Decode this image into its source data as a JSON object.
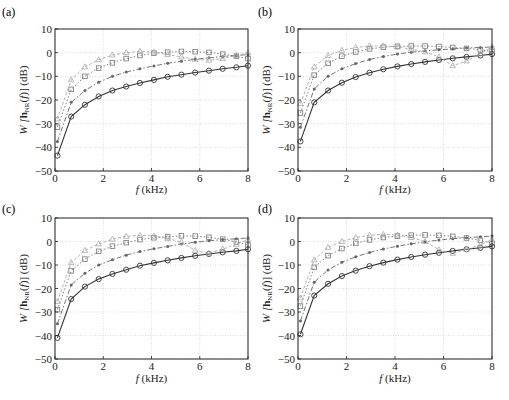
{
  "chart_data": [
    {
      "type": "line",
      "panel_label": "(a)",
      "xlabel": "f (kHz)",
      "ylabel": "W [h_NR(f)] (dB)",
      "ylabel_parts": {
        "script": "W",
        "bold": "h",
        "sub": "NR",
        "arg": "(f)",
        "unit": "(dB)"
      },
      "xlim": [
        0,
        8
      ],
      "ylim": [
        -50,
        10
      ],
      "xticks": [
        0,
        2,
        4,
        6,
        8
      ],
      "yticks": [
        10,
        0,
        -10,
        -20,
        -30,
        -40,
        -50
      ],
      "grid": true,
      "x": [
        0.1,
        0.67,
        1.24,
        1.81,
        2.38,
        2.95,
        3.52,
        4.1,
        4.67,
        5.24,
        5.81,
        6.38,
        6.95,
        7.52,
        8.0
      ],
      "series": [
        {
          "name": "circle-solid",
          "marker": "circle",
          "style": "solid",
          "color": "#333333",
          "values": [
            -43.5,
            -27,
            -22,
            -18.5,
            -16,
            -14.3,
            -12.8,
            -11.5,
            -10.2,
            -9.3,
            -8.4,
            -7.6,
            -6.8,
            -6.2,
            -5.5
          ]
        },
        {
          "name": "star-dashdot",
          "marker": "star",
          "style": "dashdot",
          "color": "#666666",
          "values": [
            -37.5,
            -21,
            -16,
            -12.5,
            -10,
            -8.2,
            -6.8,
            -5.6,
            -4.5,
            -3.6,
            -2.8,
            -2.2,
            -1.6,
            -1.2,
            -0.8
          ]
        },
        {
          "name": "square-dotted",
          "marker": "square",
          "style": "dotted",
          "color": "#777777",
          "values": [
            -31.5,
            -15.5,
            -10,
            -6.5,
            -4.3,
            -2.5,
            -1.2,
            -0.2,
            0.2,
            0.5,
            0.4,
            0.1,
            -0.6,
            -1.5,
            -2.5
          ]
        },
        {
          "name": "triangle-dotted",
          "marker": "triangle",
          "style": "dashed",
          "color": "#aaaaaa",
          "values": [
            -28,
            -11.5,
            -6,
            -3,
            -1,
            0,
            0.6,
            0.2,
            -0.8,
            -1.8,
            -2.8,
            -3.2,
            -2.5,
            -1.2,
            0
          ]
        }
      ]
    },
    {
      "type": "line",
      "panel_label": "(b)",
      "xlabel": "f (kHz)",
      "ylabel": "W [h_NR(f)] (dB)",
      "ylabel_parts": {
        "script": "W",
        "bold": "h",
        "sub": "NR",
        "arg": "(f)",
        "unit": "(dB)"
      },
      "xlim": [
        0,
        8
      ],
      "ylim": [
        -50,
        10
      ],
      "xticks": [
        0,
        2,
        4,
        6,
        8
      ],
      "yticks": [
        10,
        0,
        -10,
        -20,
        -30,
        -40,
        -50
      ],
      "grid": true,
      "x": [
        0.1,
        0.67,
        1.24,
        1.81,
        2.38,
        2.95,
        3.52,
        4.1,
        4.67,
        5.24,
        5.81,
        6.38,
        6.95,
        7.52,
        8.0
      ],
      "series": [
        {
          "name": "circle-solid",
          "marker": "circle",
          "style": "solid",
          "color": "#333333",
          "values": [
            -37.5,
            -21,
            -16,
            -12.7,
            -10.3,
            -8.5,
            -7,
            -5.8,
            -4.8,
            -3.9,
            -3.1,
            -2.4,
            -1.8,
            -1.2,
            -0.6
          ]
        },
        {
          "name": "star-dashdot",
          "marker": "star",
          "style": "dashdot",
          "color": "#666666",
          "values": [
            -31.5,
            -15.3,
            -10,
            -6.8,
            -4.6,
            -2.9,
            -1.6,
            -0.6,
            0.2,
            0.8,
            1.2,
            1.6,
            2,
            2.2,
            2.4
          ]
        },
        {
          "name": "square-dotted",
          "marker": "square",
          "style": "dotted",
          "color": "#777777",
          "values": [
            -25.5,
            -9.5,
            -4.5,
            -1.5,
            0.3,
            1.6,
            2.3,
            2.7,
            2.8,
            2.8,
            2.6,
            2.2,
            1.8,
            1.2,
            0.5
          ]
        },
        {
          "name": "triangle-dotted",
          "marker": "triangle",
          "style": "dashed",
          "color": "#aaaaaa",
          "values": [
            -21.5,
            -6,
            -1.2,
            1,
            2.2,
            2.8,
            2.9,
            2.4,
            1.5,
            0.3,
            -1.8,
            -5.5,
            -3.5,
            -0.5,
            2.5
          ]
        }
      ]
    },
    {
      "type": "line",
      "panel_label": "(c)",
      "xlabel": "f (kHz)",
      "ylabel": "W [h_NR(f)] (dB)",
      "ylabel_parts": {
        "script": "W",
        "bold": "h",
        "sub": "NR",
        "arg": "(f)",
        "unit": "(dB)"
      },
      "xlim": [
        0,
        8
      ],
      "ylim": [
        -50,
        10
      ],
      "xticks": [
        0,
        2,
        4,
        6,
        8
      ],
      "yticks": [
        10,
        0,
        -10,
        -20,
        -30,
        -40,
        -50
      ],
      "grid": true,
      "x": [
        0.1,
        0.67,
        1.24,
        1.81,
        2.38,
        2.95,
        3.52,
        4.1,
        4.67,
        5.24,
        5.81,
        6.38,
        6.95,
        7.52,
        8.0
      ],
      "series": [
        {
          "name": "circle-solid",
          "marker": "circle",
          "style": "solid",
          "color": "#333333",
          "values": [
            -41,
            -24.5,
            -19.2,
            -16,
            -13.8,
            -12,
            -10.3,
            -9.1,
            -8,
            -7,
            -6.1,
            -5.3,
            -4.6,
            -4,
            -3.3
          ]
        },
        {
          "name": "star-dashdot",
          "marker": "star",
          "style": "dashdot",
          "color": "#666666",
          "values": [
            -35,
            -18.5,
            -13.5,
            -10,
            -7.8,
            -5.8,
            -4.3,
            -3.1,
            -2.1,
            -1.1,
            -0.3,
            0.3,
            0.8,
            1.2,
            1.5
          ]
        },
        {
          "name": "square-dotted",
          "marker": "square",
          "style": "dotted",
          "color": "#777777",
          "values": [
            -29,
            -12.5,
            -7.5,
            -4.2,
            -2,
            -0.5,
            0.8,
            1.6,
            2.1,
            2.4,
            2.3,
            1.8,
            1,
            -0.2,
            -1.5
          ]
        },
        {
          "name": "triangle-dotted",
          "marker": "triangle",
          "style": "dashed",
          "color": "#aaaaaa",
          "values": [
            -25.5,
            -9,
            -3.8,
            -1,
            1,
            2.2,
            2.6,
            2.3,
            1.3,
            -0.3,
            -3.8,
            -5,
            -3.2,
            -1.2,
            0.8
          ]
        }
      ]
    },
    {
      "type": "line",
      "panel_label": "(d)",
      "xlabel": "f (kHz)",
      "ylabel": "W [h_NR(f)] (dB)",
      "ylabel_parts": {
        "script": "W",
        "bold": "h",
        "sub": "NR",
        "arg": "(f)",
        "unit": "(dB)"
      },
      "xlim": [
        0,
        8
      ],
      "ylim": [
        -50,
        10
      ],
      "xticks": [
        0,
        2,
        4,
        6,
        8
      ],
      "yticks": [
        10,
        0,
        -10,
        -20,
        -30,
        -40,
        -50
      ],
      "grid": true,
      "x": [
        0.1,
        0.67,
        1.24,
        1.81,
        2.38,
        2.95,
        3.52,
        4.1,
        4.67,
        5.24,
        5.81,
        6.38,
        6.95,
        7.52,
        8.0
      ],
      "series": [
        {
          "name": "circle-solid",
          "marker": "circle",
          "style": "solid",
          "color": "#333333",
          "values": [
            -39.5,
            -23,
            -18,
            -14.7,
            -12.4,
            -10.5,
            -9,
            -7.7,
            -6.6,
            -5.6,
            -4.8,
            -4,
            -3.3,
            -2.7,
            -2.1
          ]
        },
        {
          "name": "star-dashdot",
          "marker": "star",
          "style": "dashdot",
          "color": "#666666",
          "values": [
            -33.8,
            -17.3,
            -12.1,
            -8.8,
            -6.5,
            -4.7,
            -3.2,
            -2,
            -1,
            -0.1,
            0.6,
            1.2,
            1.6,
            2,
            2.3
          ]
        },
        {
          "name": "square-dotted",
          "marker": "square",
          "style": "dotted",
          "color": "#777777",
          "values": [
            -27.5,
            -11,
            -6,
            -3,
            -0.8,
            0.7,
            1.7,
            2.3,
            2.7,
            2.8,
            2.6,
            2.2,
            1.5,
            0.5,
            -0.8
          ]
        },
        {
          "name": "triangle-dotted",
          "marker": "triangle",
          "style": "dashed",
          "color": "#aaaaaa",
          "values": [
            -24,
            -7.8,
            -2.5,
            0,
            1.7,
            2.7,
            3,
            2.7,
            1.7,
            0,
            -3.5,
            -5,
            -3.3,
            -1.5,
            0.8
          ]
        }
      ]
    }
  ],
  "layout": {
    "panels": [
      {
        "label_pos": [
          2,
          16
        ],
        "plot": [
          55,
          29,
          248,
          171
        ],
        "xlabel_y": 193
      },
      {
        "label_pos": [
          258,
          16
        ],
        "plot": [
          298,
          29,
          492,
          171
        ],
        "xlabel_y": 193
      },
      {
        "label_pos": [
          2,
          213
        ],
        "plot": [
          55,
          218,
          248,
          359
        ],
        "xlabel_y": 382
      },
      {
        "label_pos": [
          258,
          213
        ],
        "plot": [
          298,
          218,
          492,
          359
        ],
        "xlabel_y": 382
      }
    ]
  }
}
